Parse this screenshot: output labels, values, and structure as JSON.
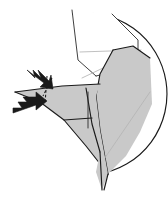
{
  "figure": {
    "kind": "origami-fold-diagram",
    "canvas": {
      "width": 168,
      "height": 197,
      "background": "#ffffff"
    },
    "colors": {
      "paper_front": "#c9c9c9",
      "paper_back": "#ffffff",
      "outline": "#1a1a1a",
      "soft_crease": "#b5b5b5",
      "arrow": "#1a1a1a",
      "background": "#ffffff"
    },
    "circle": {
      "label": "circular paper outline",
      "center_x": 86,
      "center_y": 94,
      "radius": 81
    },
    "shapes": [
      {
        "name": "upper-white-panel",
        "kind": "paper-back",
        "points": "72,10 112,14 138,40 138,66 96,76 78,60"
      },
      {
        "name": "right-gray-flap",
        "kind": "paper-front",
        "points": "112,48 150,52 152,112 126,160 104,176 96,120 92,84"
      },
      {
        "name": "left-gray-wing",
        "kind": "paper-front",
        "points": "15,92 100,86 118,118 104,176 86,140 60,118"
      },
      {
        "name": "lower-gray-point",
        "kind": "paper-front",
        "points": "104,176 100,190 96,176"
      }
    ],
    "creases": [
      {
        "name": "soft-crease-upper-horizontal",
        "style": "soft",
        "path": "M 80,52 L 140,50"
      },
      {
        "name": "soft-crease-upper-diagonal",
        "style": "soft",
        "path": "M 82,78 L 141,50"
      },
      {
        "name": "soft-crease-right-diagonal",
        "style": "soft",
        "path": "M 98,168 L 150,92"
      },
      {
        "name": "crease-vertical-dashed",
        "style": "dashed",
        "path": "M 47,76 L 45,104"
      }
    ],
    "arrows": [
      {
        "name": "fold-arrow-upper",
        "style": "zigzag-push-arrow",
        "from": {
          "x": 28,
          "y": 72
        },
        "to": {
          "x": 48,
          "y": 90
        },
        "direction": "down-right"
      },
      {
        "name": "fold-arrow-lower",
        "style": "zigzag-push-arrow",
        "from": {
          "x": 14,
          "y": 110
        },
        "to": {
          "x": 45,
          "y": 102
        },
        "direction": "right"
      }
    ]
  }
}
